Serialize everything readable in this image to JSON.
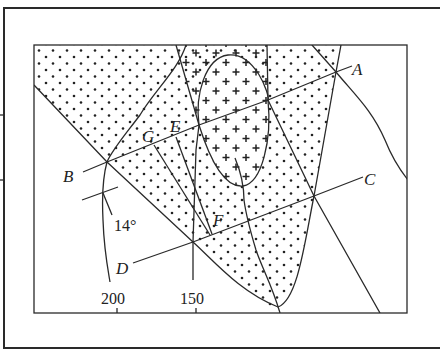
{
  "diagram": {
    "type": "geological-map",
    "point_labels": {
      "A": "A",
      "B": "B",
      "C": "C",
      "D": "D",
      "E": "E",
      "F": "F",
      "G": "G"
    },
    "dip_angle": "14°",
    "contour_labels": {
      "c200": "200",
      "c150": "150"
    },
    "legend_patterns": [
      "dotted-stratum",
      "cross-granite-intrusion"
    ],
    "colors": {
      "ink": "#2a2a2a",
      "background": "#ffffff"
    }
  }
}
